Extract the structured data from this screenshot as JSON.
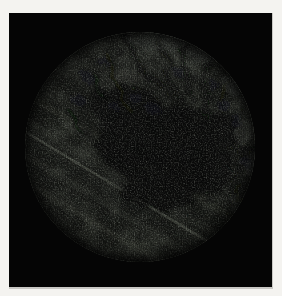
{
  "figure": {
    "type": "photograph"
  },
  "colors": {
    "page_background": "#f4f3f0",
    "photo_background": "#050505",
    "photo_edge": "#c9c8c4",
    "field_base": "#31342e",
    "field_mid": "#3c3f39",
    "field_highlight": "#565b52",
    "blotch_dark": "#0a0b09",
    "blotch_mid": "#15171a",
    "streak_light": "#4c5046",
    "streak_bright": "#666a60",
    "streak_dark": "#1e201c"
  }
}
